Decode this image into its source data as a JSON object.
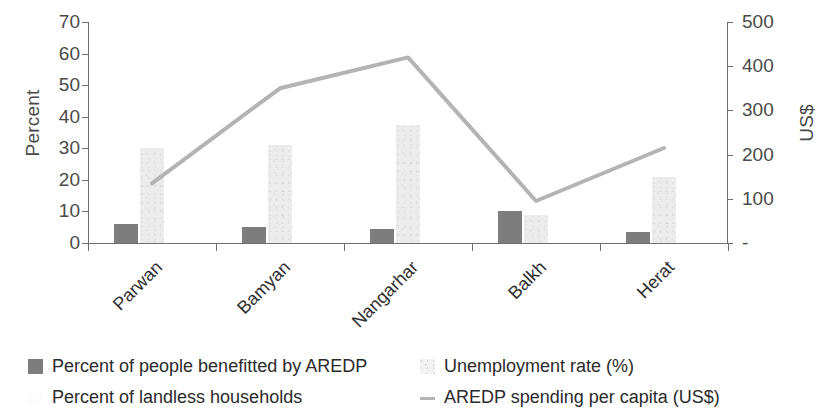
{
  "chart_data": {
    "type": "bar",
    "title": "",
    "subtitle": "",
    "categories": [
      "Parwan",
      "Bamyan",
      "Nangarhar",
      "Balkh",
      "Herat"
    ],
    "xlabel": "",
    "ylabel": "Percent",
    "ylabel_secondary": "US$",
    "ylim": [
      0,
      70
    ],
    "ylim_secondary": [
      0,
      500
    ],
    "yticks": [
      "0",
      "10",
      "20",
      "30",
      "40",
      "50",
      "60",
      "70"
    ],
    "yticks_secondary": [
      "-",
      "100",
      "200",
      "300",
      "400",
      "500"
    ],
    "grid": false,
    "legend_position": "bottom",
    "series": [
      {
        "name": "Percent of people benefitted by AREDP",
        "kind": "bar",
        "axis": "left",
        "color": "#7d7d7d",
        "values": [
          6,
          5,
          4.5,
          10,
          3.5
        ]
      },
      {
        "name": "Unemployment rate (%)",
        "kind": "bar",
        "axis": "left",
        "color": "#ececec",
        "values": [
          30,
          31,
          37.5,
          9,
          21
        ]
      },
      {
        "name": "Percent of landless households",
        "kind": "bar",
        "axis": "left",
        "color": "#fdfdfd",
        "values": [
          0,
          0,
          0,
          0,
          0
        ]
      },
      {
        "name": "AREDP spending per capita (US$)",
        "kind": "line",
        "axis": "right",
        "color": "#b4b4b4",
        "values": [
          135,
          350,
          420,
          95,
          215
        ]
      }
    ]
  },
  "legend": {
    "items": [
      {
        "label": "Percent of people benefitted by AREDP",
        "swatch": "dark-gray-square"
      },
      {
        "label": "Unemployment rate (%)",
        "swatch": "speckled-light-square"
      },
      {
        "label": "Percent of landless households",
        "swatch": "white-square"
      },
      {
        "label": "AREDP spending per capita (US$)",
        "swatch": "gray-line"
      }
    ]
  }
}
